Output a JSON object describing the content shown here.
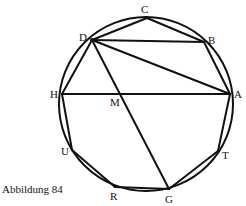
{
  "figure": {
    "caption": "Abbildung 84",
    "circle": {
      "cx": 146,
      "cy": 104,
      "r": 87
    },
    "points": {
      "A": {
        "label": "A",
        "x": 230,
        "y": 94
      },
      "B": {
        "label": "B",
        "x": 204,
        "y": 42
      },
      "C": {
        "label": "C",
        "x": 147,
        "y": 18
      },
      "D": {
        "label": "D",
        "x": 92,
        "y": 40
      },
      "H": {
        "label": "H",
        "x": 62,
        "y": 94
      },
      "M": {
        "label": "M",
        "x": 112,
        "y": 94
      },
      "U": {
        "label": "U",
        "x": 72,
        "y": 150
      },
      "R": {
        "label": "R",
        "x": 115,
        "y": 187
      },
      "G": {
        "label": "G",
        "x": 169,
        "y": 189
      },
      "T": {
        "label": "T",
        "x": 218,
        "y": 151
      }
    },
    "segments": [
      [
        "A",
        "B"
      ],
      [
        "B",
        "C"
      ],
      [
        "C",
        "D"
      ],
      [
        "D",
        "B"
      ],
      [
        "D",
        "A"
      ],
      [
        "D",
        "H"
      ],
      [
        "H",
        "A"
      ],
      [
        "D",
        "G"
      ],
      [
        "H",
        "U"
      ],
      [
        "U",
        "R"
      ],
      [
        "R",
        "G"
      ],
      [
        "G",
        "T"
      ],
      [
        "T",
        "A"
      ]
    ]
  }
}
